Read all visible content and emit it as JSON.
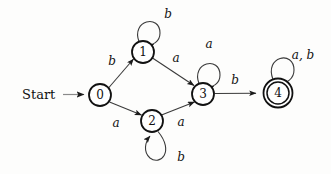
{
  "diagram": {
    "type": "finite-state-automaton",
    "start_label": "Start",
    "alphabet": [
      "a",
      "b"
    ],
    "start_state": "0",
    "accepting_states": [
      "4"
    ],
    "states": [
      {
        "id": "0",
        "label": "0",
        "x": 100,
        "y": 95,
        "r": 11,
        "accepting": false
      },
      {
        "id": "1",
        "label": "1",
        "x": 143,
        "y": 52,
        "r": 11,
        "accepting": false
      },
      {
        "id": "2",
        "label": "2",
        "x": 152,
        "y": 121,
        "r": 11,
        "accepting": false
      },
      {
        "id": "3",
        "label": "3",
        "x": 203,
        "y": 94,
        "r": 11,
        "accepting": false
      },
      {
        "id": "4",
        "label": "4",
        "x": 278,
        "y": 93,
        "r": 11,
        "r_outer": 14,
        "accepting": true
      }
    ],
    "transitions": [
      {
        "id": "t0-1",
        "from": "0",
        "to": "1",
        "label": "b",
        "label_x": 112,
        "label_y": 61
      },
      {
        "id": "t0-2",
        "from": "0",
        "to": "2",
        "label": "a",
        "label_x": 116,
        "label_y": 123
      },
      {
        "id": "t1-1",
        "from": "1",
        "to": "1",
        "label": "b",
        "label_x": 168,
        "label_y": 14,
        "self_loop": true
      },
      {
        "id": "t1-3",
        "from": "1",
        "to": "3",
        "label": "a",
        "label_x": 176,
        "label_y": 58
      },
      {
        "id": "t2-2",
        "from": "2",
        "to": "2",
        "label": "b",
        "label_x": 181,
        "label_y": 157,
        "self_loop": true
      },
      {
        "id": "t2-3",
        "from": "2",
        "to": "3",
        "label": "a",
        "label_x": 181,
        "label_y": 122
      },
      {
        "id": "t3-3",
        "from": "3",
        "to": "3",
        "label": "a",
        "label_x": 209,
        "label_y": 44,
        "self_loop": true
      },
      {
        "id": "t3-4",
        "from": "3",
        "to": "4",
        "label": "b",
        "label_x": 235,
        "label_y": 80
      },
      {
        "id": "t4-4",
        "from": "4",
        "to": "4",
        "label": "a, b",
        "label_x": 303,
        "label_y": 55,
        "self_loop": true
      }
    ],
    "colors": {
      "background": "#fdfdfc",
      "stroke": "#111111",
      "edge": "#3a3a3a",
      "start_arrow": "#8a8a8a"
    }
  }
}
